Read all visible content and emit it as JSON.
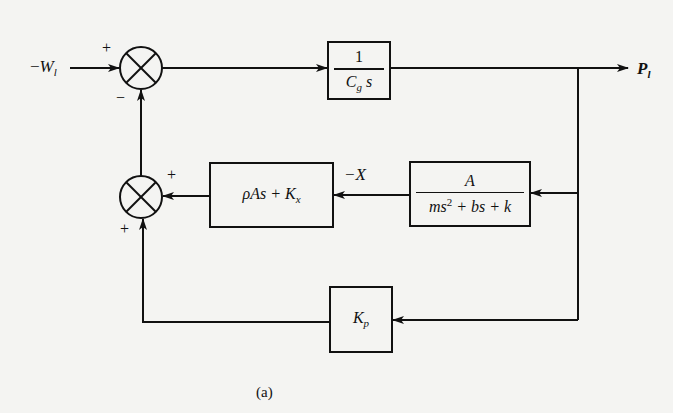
{
  "diagram": {
    "type": "block-diagram",
    "caption": "(a)",
    "input": {
      "sign": "−",
      "symbol": "W",
      "subscript": "l"
    },
    "output": {
      "symbol": "P",
      "subscript": "l"
    },
    "summing_junctions": [
      {
        "id": "sum-top",
        "signs": {
          "left": "+",
          "bottom": "−"
        }
      },
      {
        "id": "sum-bottom",
        "signs": {
          "right": "+",
          "bottom": "+"
        }
      }
    ],
    "blocks": [
      {
        "id": "compliance",
        "numerator": "1",
        "denominator_base": "C",
        "denominator_sub": "g",
        "denominator_tail": " s"
      },
      {
        "id": "flow-gain",
        "expr_a": "ρAs + K",
        "expr_sub": "x"
      },
      {
        "id": "mechanical",
        "numerator": "A",
        "den_part1": "ms",
        "den_sup": "2",
        "den_part2": " + bs + k"
      },
      {
        "id": "pressure-gain",
        "base": "K",
        "sub": "p"
      }
    ],
    "signals": [
      {
        "id": "neg-x",
        "label": "−X"
      }
    ],
    "colors": {
      "background": "#f4f4f2",
      "stroke": "#111111"
    }
  }
}
